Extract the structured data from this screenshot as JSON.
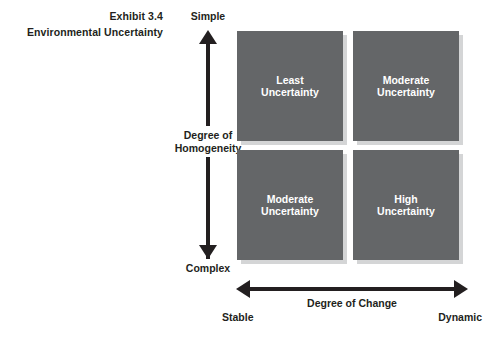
{
  "exhibit": {
    "number_line": "Exhibit 3.4",
    "title_line": "Environmental Uncertainty"
  },
  "vertical_axis": {
    "label": "Degree of\nHomogeneity",
    "label_line1": "Degree of",
    "label_line2": "Homogeneity",
    "top_label": "Simple",
    "bottom_label": "Complex"
  },
  "horizontal_axis": {
    "label": "Degree of Change",
    "left_label": "Stable",
    "right_label": "Dynamic"
  },
  "quadrants": [
    {
      "position": "top-left",
      "line1": "Least",
      "line2": "Uncertainty"
    },
    {
      "position": "top-right",
      "line1": "Moderate",
      "line2": "Uncertainty"
    },
    {
      "position": "bottom-left",
      "line1": "Moderate",
      "line2": "Uncertainty"
    },
    {
      "position": "bottom-right",
      "line1": "High",
      "line2": "Uncertainty"
    }
  ],
  "colors": {
    "box_fill": "#646668",
    "box_shadow": "#d4d5d6",
    "text": "#231f20",
    "box_text": "#ffffff",
    "background": "#ffffff"
  }
}
